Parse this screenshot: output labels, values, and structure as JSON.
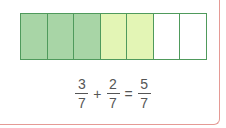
{
  "diagram": {
    "type": "fraction-bar",
    "total_parts": 7,
    "cells": [
      {
        "state": "first-addend",
        "color": "#a8d5a6"
      },
      {
        "state": "first-addend",
        "color": "#a8d5a6"
      },
      {
        "state": "first-addend",
        "color": "#a8d5a6"
      },
      {
        "state": "second-addend",
        "color": "#e3f5b5"
      },
      {
        "state": "second-addend",
        "color": "#e3f5b5"
      },
      {
        "state": "empty",
        "color": "#ffffff"
      },
      {
        "state": "empty",
        "color": "#ffffff"
      }
    ],
    "border_color": "#4f9a5c",
    "card_border_color": "#e59a95"
  },
  "equation": {
    "a": {
      "numerator": "3",
      "denominator": "7"
    },
    "op1": "+",
    "b": {
      "numerator": "2",
      "denominator": "7"
    },
    "op2": "=",
    "result": {
      "numerator": "5",
      "denominator": "7"
    }
  }
}
